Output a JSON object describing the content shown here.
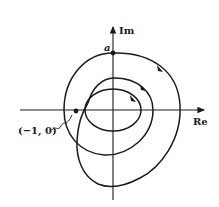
{
  "diagram": {
    "axes": {
      "x_label": "Re",
      "y_label": "Im"
    },
    "points": [
      {
        "name": "a",
        "label": "a"
      },
      {
        "name": "critical-point",
        "label": "(−1, 0)"
      }
    ],
    "curve": {
      "description": "Clockwise spiral contour encircling the origin, starting at point a on the imaginary axis",
      "direction": "clockwise",
      "arrow_count": 3
    },
    "colors": {
      "ink": "#1a1a1a",
      "background": "#ffffff"
    }
  }
}
